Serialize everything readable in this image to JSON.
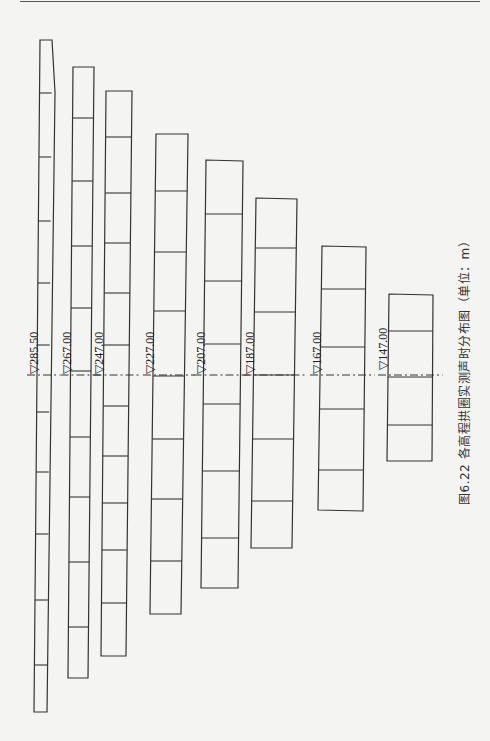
{
  "page": {
    "caption": "图6.22  各高程拱圈实测声时分布图（单位：m）",
    "centerline_y": 375,
    "line_color": "#333333"
  },
  "columns": [
    {
      "label": "▽285.50",
      "elevation": 285.5,
      "top_left": [
        40,
        40
      ],
      "top_right": [
        52,
        40
      ],
      "bot_left": [
        34,
        712
      ],
      "bot_right": [
        47,
        712
      ],
      "bulge_top_right": [
        55,
        92
      ],
      "dividers": [
        93,
        157,
        221,
        283,
        345,
        412,
        472,
        534,
        600,
        665
      ]
    },
    {
      "label": "▽267.00",
      "elevation": 267.0,
      "top_left": [
        73,
        67
      ],
      "top_right": [
        94,
        67
      ],
      "bot_left": [
        68,
        678
      ],
      "bot_right": [
        88,
        678
      ],
      "dividers": [
        118,
        181,
        246,
        308,
        371,
        437,
        497,
        562,
        627
      ]
    },
    {
      "label": "▽247.00",
      "elevation": 247.0,
      "top_left": [
        106,
        91
      ],
      "top_right": [
        132,
        91
      ],
      "bot_left": [
        101,
        656
      ],
      "bot_right": [
        126,
        656
      ],
      "dividers": [
        137,
        193,
        243,
        293,
        345,
        406,
        456,
        503,
        550,
        603
      ]
    },
    {
      "label": "▽227.00",
      "elevation": 227.0,
      "top_left": [
        156,
        134
      ],
      "top_right": [
        188,
        134
      ],
      "bot_left": [
        150,
        614
      ],
      "bot_right": [
        181,
        614
      ],
      "dividers": [
        191,
        252,
        311,
        376,
        439,
        499,
        561
      ]
    },
    {
      "label": "▽207.00",
      "elevation": 207.0,
      "top_left": [
        206,
        160
      ],
      "top_right": [
        243,
        161
      ],
      "bot_left": [
        201,
        588
      ],
      "bot_right": [
        238,
        588
      ],
      "dividers": [
        214,
        281,
        344,
        404,
        471,
        538
      ]
    },
    {
      "label": "▽187.00",
      "elevation": 187.0,
      "top_left": [
        256,
        198
      ],
      "top_right": [
        297,
        199
      ],
      "bot_left": [
        251,
        548
      ],
      "bot_right": [
        292,
        548
      ],
      "dividers": [
        248,
        312,
        375,
        439,
        501
      ]
    },
    {
      "label": "▽167.00",
      "elevation": 167.0,
      "top_left": [
        322,
        246
      ],
      "top_right": [
        366,
        247
      ],
      "bot_left": [
        318,
        510
      ],
      "bot_right": [
        363,
        511
      ],
      "dividers": [
        289,
        347,
        409,
        470
      ]
    },
    {
      "label": "▽147.00",
      "elevation": 147.0,
      "top_left": [
        389,
        294
      ],
      "top_right": [
        433,
        295
      ],
      "bot_left": [
        387,
        461
      ],
      "bot_right": [
        432,
        461
      ],
      "dividers": [
        331,
        377,
        425
      ]
    }
  ]
}
